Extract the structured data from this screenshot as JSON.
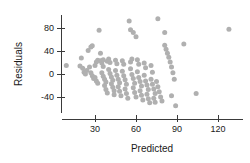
{
  "chart_data": {
    "type": "scatter",
    "title": "",
    "xlabel": "Predicted",
    "ylabel": "Residuals",
    "xlim": [
      5,
      133
    ],
    "ylim": [
      -75,
      100
    ],
    "grid": false,
    "legend": null,
    "point_color": "#b0b0b0",
    "axis_color": "#3a3a3a",
    "background": "#ffffff",
    "xticks": [
      30,
      60,
      90,
      120
    ],
    "xtick_labels": [
      "30",
      "60",
      "90",
      "120"
    ],
    "yticks": [
      -40,
      0,
      40,
      80
    ],
    "ytick_labels": [
      "-40",
      "0",
      "40",
      "80"
    ],
    "points": [
      [
        9,
        15
      ],
      [
        20,
        28
      ],
      [
        19,
        14
      ],
      [
        21,
        10
      ],
      [
        22,
        3
      ],
      [
        23,
        0
      ],
      [
        24,
        6
      ],
      [
        25,
        41
      ],
      [
        27,
        47
      ],
      [
        28,
        49
      ],
      [
        26,
        12
      ],
      [
        27,
        2
      ],
      [
        28,
        -3
      ],
      [
        29,
        -8
      ],
      [
        30,
        15
      ],
      [
        31,
        21
      ],
      [
        32,
        24
      ],
      [
        30,
        -6
      ],
      [
        31,
        -12
      ],
      [
        32,
        -16
      ],
      [
        33,
        76
      ],
      [
        34,
        36
      ],
      [
        34,
        23
      ],
      [
        35,
        19
      ],
      [
        36,
        25
      ],
      [
        36,
        13
      ],
      [
        35,
        2
      ],
      [
        36,
        -4
      ],
      [
        37,
        -9
      ],
      [
        38,
        -14
      ],
      [
        37,
        -20
      ],
      [
        38,
        -27
      ],
      [
        39,
        -33
      ],
      [
        39,
        22
      ],
      [
        40,
        26
      ],
      [
        41,
        20
      ],
      [
        40,
        8
      ],
      [
        41,
        1
      ],
      [
        42,
        -5
      ],
      [
        43,
        -11
      ],
      [
        42,
        -17
      ],
      [
        43,
        -23
      ],
      [
        44,
        -29
      ],
      [
        44,
        -36
      ],
      [
        45,
        24
      ],
      [
        46,
        18
      ],
      [
        45,
        6
      ],
      [
        46,
        -2
      ],
      [
        47,
        -9
      ],
      [
        48,
        -15
      ],
      [
        47,
        -22
      ],
      [
        48,
        -30
      ],
      [
        49,
        -38
      ],
      [
        50,
        23
      ],
      [
        51,
        17
      ],
      [
        50,
        5
      ],
      [
        51,
        -3
      ],
      [
        52,
        -10
      ],
      [
        53,
        -18
      ],
      [
        52,
        -26
      ],
      [
        53,
        -34
      ],
      [
        54,
        -42
      ],
      [
        55,
        92
      ],
      [
        56,
        21
      ],
      [
        57,
        26
      ],
      [
        56,
        9
      ],
      [
        57,
        -1
      ],
      [
        58,
        -8
      ],
      [
        59,
        -16
      ],
      [
        58,
        -24
      ],
      [
        59,
        -32
      ],
      [
        60,
        -40
      ],
      [
        56,
        77
      ],
      [
        58,
        72
      ],
      [
        61,
        25
      ],
      [
        62,
        17
      ],
      [
        61,
        4
      ],
      [
        62,
        -6
      ],
      [
        63,
        -13
      ],
      [
        64,
        -21
      ],
      [
        63,
        -29
      ],
      [
        64,
        -37
      ],
      [
        65,
        -45
      ],
      [
        60,
        65
      ],
      [
        66,
        19
      ],
      [
        67,
        11
      ],
      [
        66,
        -2
      ],
      [
        67,
        -12
      ],
      [
        68,
        -19
      ],
      [
        69,
        -27
      ],
      [
        68,
        -35
      ],
      [
        69,
        -43
      ],
      [
        70,
        -50
      ],
      [
        71,
        15
      ],
      [
        72,
        3
      ],
      [
        71,
        -9
      ],
      [
        72,
        -18
      ],
      [
        73,
        -26
      ],
      [
        74,
        -34
      ],
      [
        73,
        -42
      ],
      [
        74,
        -49
      ],
      [
        76,
        96
      ],
      [
        75,
        -13
      ],
      [
        76,
        -22
      ],
      [
        77,
        -31
      ],
      [
        78,
        -40
      ],
      [
        79,
        -47
      ],
      [
        81,
        72
      ],
      [
        81,
        50
      ],
      [
        82,
        43
      ],
      [
        83,
        36
      ],
      [
        84,
        29
      ],
      [
        85,
        21
      ],
      [
        86,
        12
      ],
      [
        87,
        2
      ],
      [
        88,
        -9
      ],
      [
        86,
        -38
      ],
      [
        89,
        -55
      ],
      [
        95,
        52
      ],
      [
        104,
        -34
      ],
      [
        128,
        78
      ]
    ]
  },
  "axis_titles": {
    "x": "Predicted",
    "y": "Residuals"
  }
}
